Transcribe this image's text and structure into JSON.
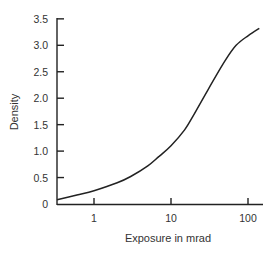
{
  "chart_data": {
    "type": "line",
    "title": "",
    "xlabel": "Exposure in mrad",
    "ylabel": "Density",
    "xscale": "log",
    "xlim": [
      0.33,
      180
    ],
    "ylim": [
      0,
      3.5
    ],
    "grid": false,
    "legend": null,
    "x_ticks": [
      1,
      10,
      100
    ],
    "x_tick_labels": [
      "1",
      "10",
      "100"
    ],
    "y_ticks": [
      0,
      0.5,
      1.0,
      1.5,
      2.0,
      2.5,
      3.0,
      3.5
    ],
    "y_tick_labels": [
      "0",
      "0.5",
      "1.0",
      "1.5",
      "2.0",
      "2.5",
      "3.0",
      "3.5"
    ],
    "series": [
      {
        "name": "Characteristic curve",
        "color": "#222222",
        "x": [
          0.33,
          0.6,
          1,
          2,
          3,
          5,
          7,
          10,
          15,
          20,
          30,
          50,
          70,
          100,
          140
        ],
        "y": [
          0.08,
          0.17,
          0.25,
          0.4,
          0.52,
          0.72,
          0.9,
          1.1,
          1.4,
          1.7,
          2.15,
          2.7,
          3.0,
          3.18,
          3.32
        ]
      }
    ]
  }
}
